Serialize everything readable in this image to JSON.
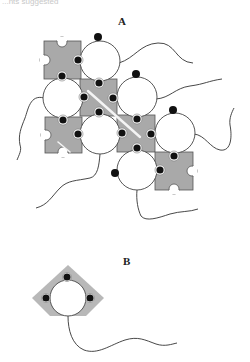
{
  "caption_fragment": "...nts suggested",
  "panels": {
    "a": {
      "label": "A"
    },
    "b": {
      "label": "B"
    }
  },
  "colors": {
    "puzzle_fill": "#a9a9a9",
    "puzzle_stroke": "#555555",
    "circle_fill": "#ffffff",
    "circle_stroke": "#444444",
    "dot_fill": "#111111",
    "tail_stroke": "#333333",
    "highlight_line": "#f2f2f2"
  }
}
